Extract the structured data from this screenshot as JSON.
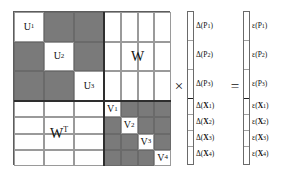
{
  "diagram": {
    "colors": {
      "gray_block": "#7a7a7a",
      "white_block": "#ffffff",
      "grid_line": "#9a9a9a",
      "partition_line": "#2e2e2e",
      "text": "#111111"
    },
    "matrix": {
      "rows": 7,
      "cols": 7,
      "blocks": {
        "upper_left": {
          "name": "U",
          "rows": 3,
          "cols": 3,
          "fill": "gray",
          "diagonal_fill": "white",
          "diagonal_labels": [
            "U1",
            "U2",
            "U3"
          ],
          "diagonal_label_base": "U",
          "diagonal_label_subs": [
            "1",
            "2",
            "3"
          ]
        },
        "upper_right": {
          "name": "W",
          "label": "W",
          "rows": 3,
          "cols": 4,
          "fill": "white"
        },
        "lower_left": {
          "name": "W-transpose",
          "label": "W",
          "superscript": "T",
          "rows": 4,
          "cols": 3,
          "fill": "white"
        },
        "lower_right": {
          "name": "V",
          "rows": 4,
          "cols": 4,
          "fill": "gray",
          "diagonal_fill": "white",
          "diagonal_labels": [
            "V1",
            "V2",
            "V3",
            "V4"
          ],
          "diagonal_label_base": "V",
          "diagonal_label_subs": [
            "1",
            "2",
            "3",
            "4"
          ]
        }
      }
    },
    "operators": {
      "multiply": "×",
      "equals": "="
    },
    "delta_vector": {
      "name": "delta-vector",
      "segments": [
        {
          "symbol": "Δ",
          "base": "P",
          "sup": "1",
          "sub": "",
          "bold_base": false,
          "group": "P"
        },
        {
          "symbol": "Δ",
          "base": "P",
          "sup": "2",
          "sub": "",
          "bold_base": false,
          "group": "P"
        },
        {
          "symbol": "Δ",
          "base": "P",
          "sup": "3",
          "sub": "",
          "bold_base": false,
          "group": "P"
        },
        {
          "symbol": "Δ",
          "base": "X",
          "sup": "",
          "sub": "1",
          "bold_base": true,
          "group": "X"
        },
        {
          "symbol": "Δ",
          "base": "X",
          "sup": "",
          "sub": "2",
          "bold_base": true,
          "group": "X"
        },
        {
          "symbol": "Δ",
          "base": "X",
          "sup": "",
          "sub": "3",
          "bold_base": true,
          "group": "X"
        },
        {
          "symbol": "Δ",
          "base": "X",
          "sup": "",
          "sub": "4",
          "bold_base": true,
          "group": "X"
        }
      ],
      "labels": [
        "Δ(P1)",
        "Δ(P2)",
        "Δ(P3)",
        "Δ(X1)",
        "Δ(X2)",
        "Δ(X3)",
        "Δ(X4)"
      ]
    },
    "epsilon_vector": {
      "name": "epsilon-vector",
      "segments": [
        {
          "symbol": "ε",
          "base": "P",
          "sup": "1",
          "sub": "",
          "bold_base": false,
          "group": "P"
        },
        {
          "symbol": "ε",
          "base": "P",
          "sup": "2",
          "sub": "",
          "bold_base": false,
          "group": "P"
        },
        {
          "symbol": "ε",
          "base": "P",
          "sup": "3",
          "sub": "",
          "bold_base": false,
          "group": "P"
        },
        {
          "symbol": "ε",
          "base": "X",
          "sup": "",
          "sub": "1",
          "bold_base": true,
          "group": "X"
        },
        {
          "symbol": "ε",
          "base": "X",
          "sup": "",
          "sub": "2",
          "bold_base": true,
          "group": "X"
        },
        {
          "symbol": "ε",
          "base": "X",
          "sup": "",
          "sub": "3",
          "bold_base": true,
          "group": "X"
        },
        {
          "symbol": "ε",
          "base": "X",
          "sup": "",
          "sub": "4",
          "bold_base": true,
          "group": "X"
        }
      ],
      "labels": [
        "ε(P1)",
        "ε(P2)",
        "ε(P3)",
        "ε(X1)",
        "ε(X2)",
        "ε(X3)",
        "ε(X4)"
      ]
    }
  }
}
